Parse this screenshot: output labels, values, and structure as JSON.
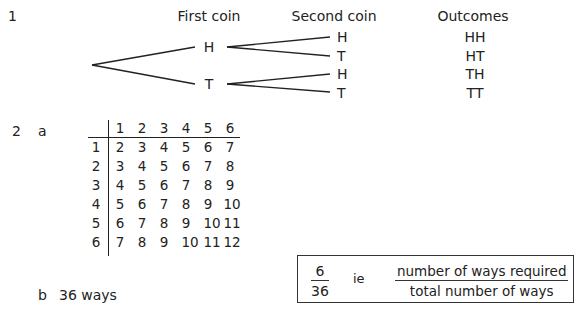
{
  "question1": {
    "number": "1",
    "headers": {
      "first": "First coin",
      "second": "Second coin",
      "outcomes": "Outcomes"
    },
    "first_coin": [
      "H",
      "T"
    ],
    "second_coin": [
      "H",
      "T",
      "H",
      "T"
    ],
    "outcomes": [
      "HH",
      "HT",
      "TH",
      "TT"
    ]
  },
  "question2": {
    "number": "2",
    "part_a": "a",
    "part_b": "b",
    "part_b_answer": "36 ways",
    "table": {
      "col_headers": [
        "1",
        "2",
        "3",
        "4",
        "5",
        "6"
      ],
      "row_headers": [
        "1",
        "2",
        "3",
        "4",
        "5",
        "6"
      ],
      "rows": [
        [
          "2",
          "3",
          "4",
          "5",
          "6",
          "7"
        ],
        [
          "3",
          "4",
          "5",
          "6",
          "7",
          "8"
        ],
        [
          "4",
          "5",
          "6",
          "7",
          "8",
          "9"
        ],
        [
          "5",
          "6",
          "7",
          "8",
          "9",
          "10"
        ],
        [
          "6",
          "7",
          "8",
          "9",
          "10",
          "11"
        ],
        [
          "7",
          "8",
          "9",
          "10",
          "11",
          "12"
        ]
      ]
    },
    "box": {
      "numerator": "6",
      "denominator": "36",
      "ie": "ie",
      "word_numerator": "number of ways required",
      "word_denominator": "total number of ways"
    }
  }
}
